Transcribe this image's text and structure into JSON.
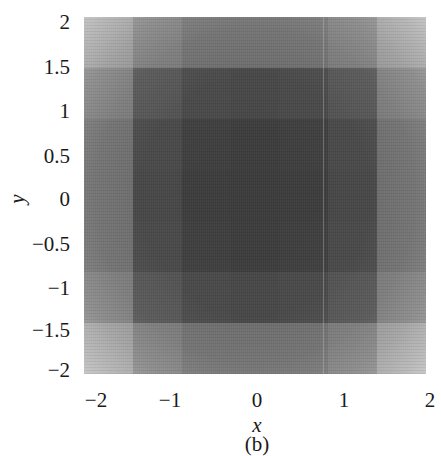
{
  "figure": {
    "caption": "(b)"
  },
  "colors": {
    "center": "#353535",
    "edge": "#d0d0d0",
    "corner": "#e6e6e6"
  },
  "chart_data": {
    "type": "heatmap",
    "title": "",
    "caption": "(b)",
    "xlabel": "x",
    "ylabel": "y",
    "xlim": [
      -2,
      2
    ],
    "ylim": [
      -2,
      2
    ],
    "x_ticks": [
      "−2",
      "−1",
      "0",
      "1",
      "2"
    ],
    "y_ticks": [
      "2",
      "1.5",
      "1",
      "0.5",
      "0",
      "−0.5",
      "−1",
      "−1.5",
      "−2"
    ],
    "colormap": "grayscale (dark = high, light = low)",
    "grid": false,
    "legend": null,
    "grid_7x7_intensity": [
      [
        0.15,
        0.35,
        0.45,
        0.45,
        0.45,
        0.35,
        0.15
      ],
      [
        0.35,
        0.7,
        0.8,
        0.82,
        0.8,
        0.7,
        0.35
      ],
      [
        0.45,
        0.8,
        0.9,
        0.92,
        0.9,
        0.8,
        0.45
      ],
      [
        0.45,
        0.82,
        0.92,
        0.93,
        0.92,
        0.82,
        0.45
      ],
      [
        0.45,
        0.8,
        0.9,
        0.92,
        0.9,
        0.8,
        0.45
      ],
      [
        0.35,
        0.7,
        0.8,
        0.82,
        0.8,
        0.7,
        0.35
      ],
      [
        0.12,
        0.35,
        0.45,
        0.45,
        0.45,
        0.35,
        0.12
      ]
    ],
    "annotations": [
      {
        "type": "vertical_line",
        "x": 0.75,
        "style": "faint light"
      }
    ]
  }
}
